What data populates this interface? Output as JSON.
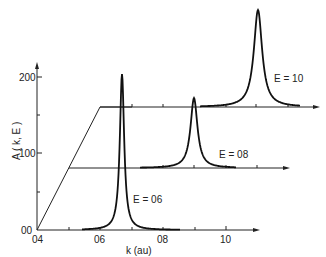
{
  "chart_data": {
    "type": "line",
    "title": "",
    "xlabel": "k (au)",
    "ylabel": "A(k,E)",
    "x_ticks": [
      "0.4",
      "0.6",
      "0.8",
      "1.0"
    ],
    "x_tick_labels_display": [
      "04",
      "06",
      "08",
      "10"
    ],
    "y_ticks": [
      "0",
      "100",
      "200"
    ],
    "y_tick_labels_display": [
      "00",
      "100",
      "200"
    ],
    "xlim": [
      0.4,
      1.1
    ],
    "ylim": [
      0,
      200
    ],
    "grid": false,
    "legend": null,
    "perspective_offset": {
      "dk_per_step": 0.1,
      "dA_per_step": 80
    },
    "series": [
      {
        "name": "E = 0.6",
        "label_display": "E = 06",
        "peak_k": 0.67,
        "peak_A": 205,
        "width_k": 0.012,
        "baseline_A": 0
      },
      {
        "name": "E = 0.8",
        "label_display": "E = 08",
        "peak_k": 0.89,
        "peak_A": 92,
        "width_k": 0.018,
        "baseline_A": 80
      },
      {
        "name": "E = 1.0",
        "label_display": "E = 10",
        "peak_k": 1.1,
        "peak_A": 127,
        "width_k": 0.022,
        "baseline_A": 160
      }
    ]
  },
  "labels": {
    "y_axis": "A ( k, E )",
    "x_axis": "k (au)",
    "y200": "200",
    "y100": "100",
    "y0": "00",
    "x04": "04",
    "x06": "06",
    "x08": "08",
    "x10": "10",
    "e06": "E = 06",
    "e08": "E = 08",
    "e10": "E = 10"
  }
}
